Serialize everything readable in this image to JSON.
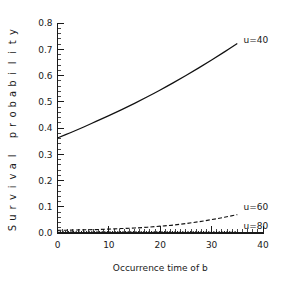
{
  "chart_data": {
    "type": "line",
    "title": "",
    "xlabel": "Occurrence time of b",
    "ylabel": "Survival probability",
    "xlim": [
      0,
      40
    ],
    "ylim": [
      0.0,
      0.8
    ],
    "grid": false,
    "legend_position": "right-inline",
    "x_ticks": [
      0,
      10,
      20,
      30,
      40
    ],
    "x_tick_labels": [
      "0",
      "10",
      "20",
      "30",
      "40"
    ],
    "x_minor_tick_step": 1,
    "y_ticks": [
      0.0,
      0.1,
      0.2,
      0.3,
      0.4,
      0.5,
      0.6,
      0.7,
      0.8
    ],
    "y_tick_labels": [
      "0.0",
      "0.1",
      "0.2",
      "0.3",
      "0.4",
      "0.5",
      "0.6",
      "0.7",
      "0.8"
    ],
    "y_minor_tick_step": 0.02,
    "series": [
      {
        "name": "u=40",
        "label": "u=40",
        "style": "solid",
        "color": "#111111",
        "x": [
          0,
          2.5,
          5,
          7.5,
          10,
          12.5,
          15,
          17.5,
          20,
          22.5,
          25,
          27.5,
          30,
          32.5,
          35
        ],
        "values": [
          0.362,
          0.382,
          0.403,
          0.425,
          0.447,
          0.47,
          0.494,
          0.519,
          0.545,
          0.572,
          0.6,
          0.629,
          0.659,
          0.69,
          0.722
        ]
      },
      {
        "name": "u=60",
        "label": "u=60",
        "style": "dashed",
        "color": "#111111",
        "x": [
          0,
          2.5,
          5,
          7.5,
          10,
          12.5,
          15,
          17.5,
          20,
          22.5,
          25,
          27.5,
          30,
          32.5,
          35
        ],
        "values": [
          0.01,
          0.011,
          0.012,
          0.013,
          0.015,
          0.017,
          0.019,
          0.022,
          0.026,
          0.03,
          0.036,
          0.043,
          0.051,
          0.06,
          0.07
        ]
      },
      {
        "name": "u=80",
        "label": "u=80",
        "style": "dotted",
        "color": "#111111",
        "x": [
          0,
          5,
          10,
          15,
          20,
          25,
          30,
          35
        ],
        "values": [
          0.005,
          0.005,
          0.005,
          0.005,
          0.005,
          0.005,
          0.005,
          0.005
        ]
      }
    ],
    "annotations": [
      {
        "text": "u=40",
        "x": 36.2,
        "y": 0.735
      },
      {
        "text": "u=60",
        "x": 36.2,
        "y": 0.098
      },
      {
        "text": "u=80",
        "x": 36.2,
        "y": 0.028
      }
    ]
  },
  "ylabel_letters": [
    "S",
    "u",
    "r",
    "v",
    "i",
    "v",
    "a",
    "l",
    " ",
    "p",
    "r",
    "o",
    "b",
    "a",
    "b",
    "i",
    "l",
    "i",
    "t",
    "y"
  ]
}
